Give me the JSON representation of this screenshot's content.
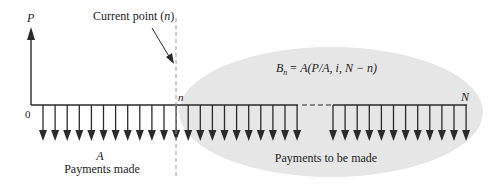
{
  "diagram": {
    "type": "cash-flow-diagram",
    "axis_label_vertical": "P",
    "origin_label": "0",
    "current_point_label": "Current point (n)",
    "current_point_text": "Current point (",
    "current_point_var": "n",
    "current_point_close": ")",
    "period_n_label": "n",
    "period_N_label": "N",
    "payment_label": "A",
    "payments_made_label": "Payments made",
    "payments_to_be_made_label": "Payments to be made",
    "formula": {
      "full": "B_n = A(P/A, i, N − n)",
      "lhs_var": "B",
      "lhs_sub": "n",
      "rhs": "= A(P/A, i, N − n)"
    },
    "colors": {
      "ellipse_fill": "#e6e6e6",
      "line": "#2a2a2a",
      "dashed_line": "#9a9a9a",
      "text": "#222222"
    },
    "arrows": {
      "direction": "down",
      "left_cluster_count": 22,
      "right_cluster_count": 12,
      "left_cluster_start_x": 43,
      "right_cluster_start_x": 333,
      "spacing": 12.1
    }
  }
}
